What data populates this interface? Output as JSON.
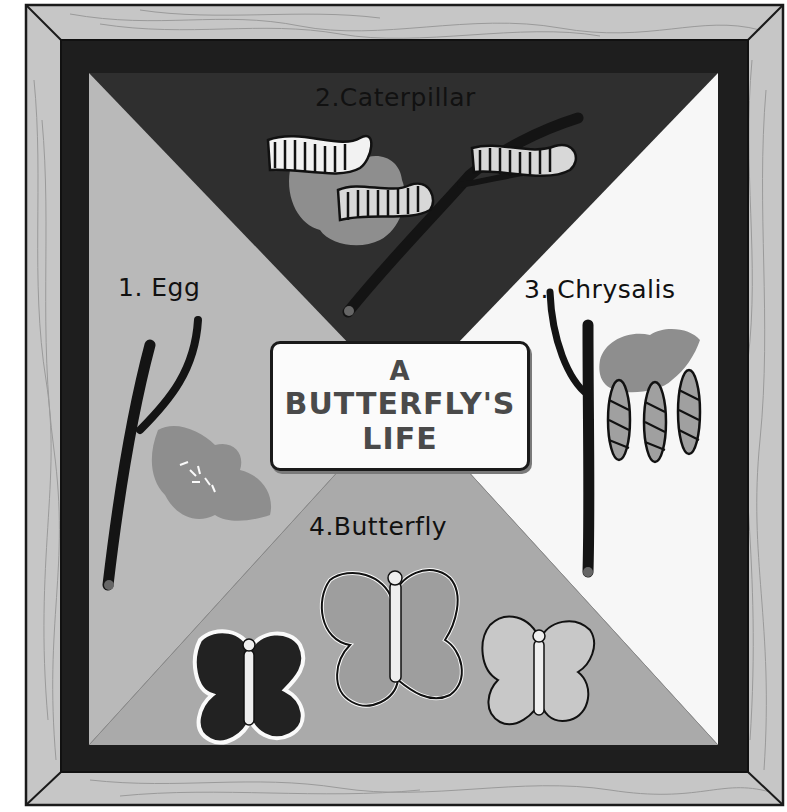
{
  "title": {
    "line1": "A",
    "line2": "BUTTERFLY'S",
    "line3": "LIFE"
  },
  "stages": [
    {
      "label": "1. Egg",
      "position": "left"
    },
    {
      "label": "2.Caterpillar",
      "position": "top"
    },
    {
      "label": "3. Chrysalis",
      "position": "right"
    },
    {
      "label": "4.Butterfly",
      "position": "bottom"
    }
  ],
  "colors": {
    "frame_wood": "#c6c6c6",
    "frame_grain": "#9a9a9a",
    "frame_edge": "#1a1a1a",
    "inner_border": "#1e1e1e",
    "panel_left": "#b9b9b9",
    "panel_top": "#2f2f2f",
    "panel_right": "#f7f7f7",
    "panel_bottom": "#aaaaaa",
    "branch": "#1c1c1c",
    "leaf": "#8e8e8e",
    "sign_text": "#4a4a4a"
  }
}
